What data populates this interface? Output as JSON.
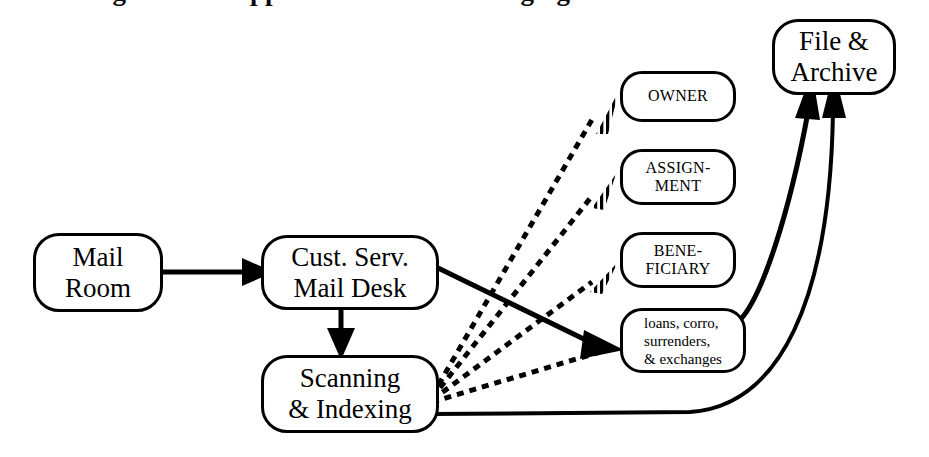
{
  "diagram": {
    "title_partial": "figure Mail Approach Workflow Imaging",
    "background_color": "#ffffff",
    "stroke_color": "#000000",
    "nodes": [
      {
        "id": "mail_room",
        "label": "Mail\nRoom"
      },
      {
        "id": "cust_serv",
        "label": "Cust. Serv.\nMail Desk"
      },
      {
        "id": "scanning",
        "label": "Scanning\n& Indexing"
      },
      {
        "id": "owner",
        "label": "OWNER"
      },
      {
        "id": "assignment",
        "label": "ASSIGN-\nMENT"
      },
      {
        "id": "beneficiary",
        "label": "BENE-\nFICIARY"
      },
      {
        "id": "loans",
        "label": "loans, corro,\nsurrenders,\n& exchanges"
      },
      {
        "id": "file_archive",
        "label": "File &\nArchive"
      }
    ],
    "edges": [
      {
        "id": "mailroom-to-custserv",
        "from": "mail_room",
        "to": "cust_serv",
        "style": "solid",
        "arrowhead": "filled-triangle"
      },
      {
        "id": "custserv-to-scanning",
        "from": "cust_serv",
        "to": "scanning",
        "style": "solid",
        "arrowhead": "filled-triangle"
      },
      {
        "id": "custserv-to-loans",
        "from": "cust_serv",
        "to": "loans",
        "style": "solid",
        "arrowhead": "filled-triangle"
      },
      {
        "id": "scanning-to-owner",
        "from": "scanning",
        "to": "owner",
        "style": "dashed",
        "arrowhead": "striped-triangle"
      },
      {
        "id": "scanning-to-assignment",
        "from": "scanning",
        "to": "assignment",
        "style": "dashed",
        "arrowhead": "striped-triangle"
      },
      {
        "id": "scanning-to-beneficiary",
        "from": "scanning",
        "to": "beneficiary",
        "style": "dashed",
        "arrowhead": "striped-triangle"
      },
      {
        "id": "scanning-to-loans",
        "from": "scanning",
        "to": "loans",
        "style": "dashed",
        "arrowhead": "striped-triangle"
      },
      {
        "id": "loans-to-archive",
        "from": "loans",
        "to": "file_archive",
        "style": "solid",
        "arrowhead": "filled-triangle"
      },
      {
        "id": "scanning-to-archive",
        "from": "scanning",
        "to": "file_archive",
        "style": "solid",
        "arrowhead": "filled-triangle"
      }
    ]
  }
}
